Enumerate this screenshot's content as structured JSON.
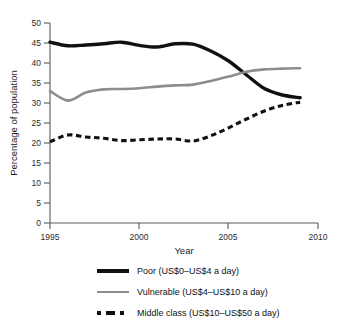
{
  "chart_data": {
    "type": "line",
    "title": "",
    "xlabel": "Year",
    "ylabel": "Percentage of population",
    "xlim": [
      1995,
      2010
    ],
    "ylim": [
      0,
      50
    ],
    "xticks": [
      1995,
      2000,
      2005,
      2010
    ],
    "yticks": [
      0,
      5,
      10,
      15,
      20,
      25,
      30,
      35,
      40,
      45,
      50
    ],
    "grid": false,
    "legend_position": "below",
    "x": [
      1995,
      1996,
      1997,
      1998,
      1999,
      2000,
      2001,
      2002,
      2003,
      2004,
      2005,
      2006,
      2007,
      2008,
      2009
    ],
    "series": [
      {
        "name": "Poor (US$0–US$4 a day)",
        "style": "solid-thick",
        "color": "#111111",
        "values": [
          45.2,
          44.3,
          44.5,
          44.8,
          45.2,
          44.4,
          44.0,
          44.8,
          44.7,
          43.0,
          40.5,
          37.0,
          33.6,
          32.0,
          31.3
        ]
      },
      {
        "name": "Vulnerable (US$4–US$10 a day)",
        "style": "solid-medium",
        "color": "#8d8d8d",
        "values": [
          33.0,
          30.6,
          32.6,
          33.4,
          33.5,
          33.7,
          34.1,
          34.4,
          34.6,
          35.5,
          36.6,
          37.8,
          38.4,
          38.6,
          38.7
        ]
      },
      {
        "name": "Middle class (US$10–US$50 a day)",
        "style": "dashed",
        "color": "#111111",
        "values": [
          20.3,
          22.0,
          21.5,
          21.2,
          20.6,
          20.8,
          21.0,
          21.0,
          20.5,
          21.8,
          23.8,
          26.0,
          28.0,
          29.4,
          30.2
        ]
      }
    ]
  },
  "legend": {
    "items": [
      {
        "label": "Poor (US$0–US$4 a day)",
        "swatch": "solid-thick-black"
      },
      {
        "label": "Vulnerable (US$4–US$10 a day)",
        "swatch": "solid-medium-gray"
      },
      {
        "label": "Middle class (US$10–US$50 a day)",
        "swatch": "dashed-black"
      }
    ]
  }
}
